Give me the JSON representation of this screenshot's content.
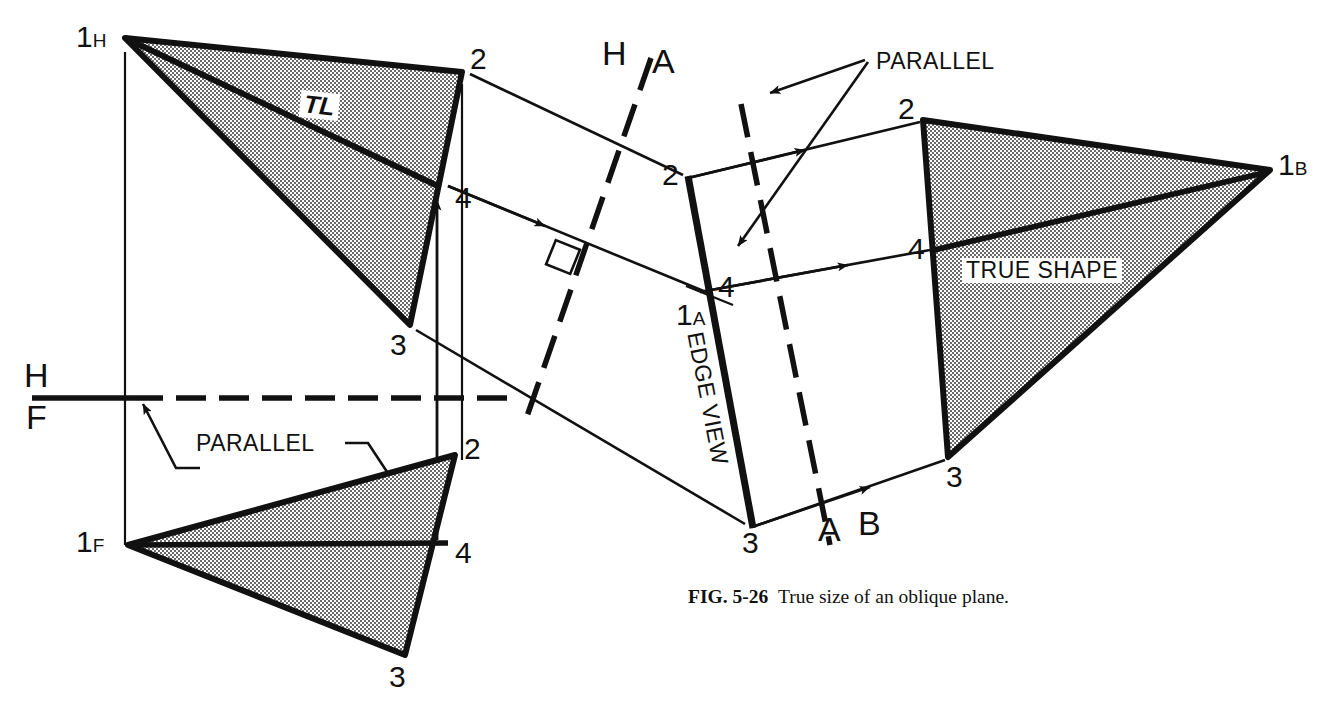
{
  "figure": {
    "caption_bold": "FIG. 5-26",
    "caption_text": "True size of an oblique plane.",
    "title": "True size of an oblique plane"
  },
  "colors": {
    "ink": "#111111",
    "paper": "#ffffff",
    "hatch_fill": "#d8d8d8"
  },
  "views": {
    "top": {
      "name": "horizontal-top-view",
      "labels": {
        "v1": "1",
        "v1_sub": "H",
        "v2": "2",
        "v3": "3",
        "v4": "4",
        "true_length": "TL"
      }
    },
    "front": {
      "name": "frontal-front-view",
      "labels": {
        "v1": "1",
        "v1_sub": "F",
        "v2": "2",
        "v3": "3",
        "v4": "4"
      }
    },
    "auxiliary_edge": {
      "name": "auxiliary-edge-view",
      "labels": {
        "v1": "1",
        "v1_sub": "A",
        "v2": "2",
        "v3": "3",
        "v4": "4",
        "edge_view": "EDGE VIEW"
      }
    },
    "auxiliary_true": {
      "name": "secondary-auxiliary-true-shape-view",
      "labels": {
        "v1": "1",
        "v1_sub": "B",
        "v2": "2",
        "v3": "3",
        "v4": "4",
        "true_shape": "TRUE SHAPE"
      }
    }
  },
  "fold_lines": {
    "hf": {
      "upper": "H",
      "lower": "F"
    },
    "ha": {
      "left": "H",
      "right": "A"
    },
    "ab": {
      "left": "A",
      "right": "B"
    }
  },
  "annotations": {
    "parallel_lower": "PARALLEL",
    "parallel_upper": "PARALLEL"
  }
}
